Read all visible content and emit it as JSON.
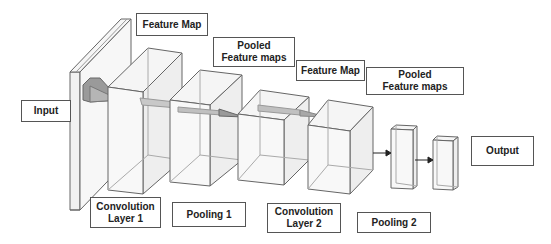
{
  "diagram": {
    "colors": {
      "stroke": "#555555",
      "face_fill": "#f3f3f3",
      "kernel_fill": "#9a9a9a",
      "kernel_light": "#c8c8c8",
      "arrow": "#222222"
    },
    "labels": {
      "input": "Input",
      "feature_map_1": "Feature Map",
      "pooled_feature_maps_1": "Pooled\nFeature maps",
      "feature_map_2": "Feature Map",
      "pooled_feature_maps_2": "Pooled\nFeature maps",
      "output": "Output",
      "convolution_layer_1": "Convolution\nLayer 1",
      "pooling_1": "Pooling 1",
      "convolution_layer_2": "Convolution\nLayer 2",
      "pooling_2": "Pooling 2"
    },
    "stages": [
      "Input",
      "Convolution Layer 1",
      "Pooling 1",
      "Convolution Layer 2",
      "Pooling 2",
      "Output"
    ]
  }
}
